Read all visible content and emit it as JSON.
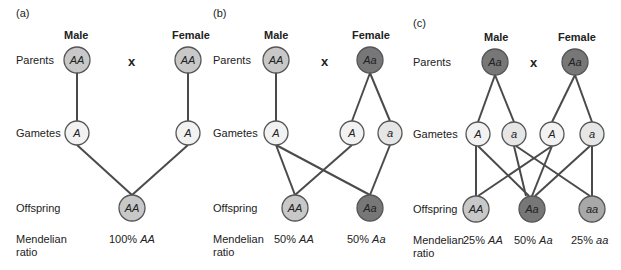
{
  "colors": {
    "homo_dominant": "#c8c8c8",
    "hetero": "#777777",
    "homo_recessive": "#a8a8a8",
    "gamete": "#f2f2f2",
    "line": "#4a4a4a"
  },
  "row_labels": {
    "parents": "Parents",
    "gametes": "Gametes",
    "offspring": "Offspring",
    "ratio_line1": "Mendelian",
    "ratio_line2": "ratio"
  },
  "cross_symbol": "x",
  "panels": [
    {
      "id": "a",
      "label": "(a)",
      "male_label": "Male",
      "female_label": "Female",
      "parents": {
        "male": "AA",
        "female": "AA"
      },
      "gametes": [
        "A",
        "A"
      ],
      "offspring": [
        "AA"
      ],
      "ratios": [
        {
          "pct": "100%",
          "genotype": "AA"
        }
      ]
    },
    {
      "id": "b",
      "label": "(b)",
      "male_label": "Male",
      "female_label": "Female",
      "parents": {
        "male": "AA",
        "female": "Aa"
      },
      "gametes": [
        "A",
        "A",
        "a"
      ],
      "offspring": [
        "AA",
        "Aa"
      ],
      "ratios": [
        {
          "pct": "50%",
          "genotype": "AA"
        },
        {
          "pct": "50%",
          "genotype": "Aa"
        }
      ]
    },
    {
      "id": "c",
      "label": "(c)",
      "male_label": "Male",
      "female_label": "Female",
      "parents": {
        "male": "Aa",
        "female": "Aa"
      },
      "gametes": [
        "A",
        "a",
        "A",
        "a"
      ],
      "offspring": [
        "AA",
        "Aa",
        "aa"
      ],
      "ratios": [
        {
          "pct": "25%",
          "genotype": "AA"
        },
        {
          "pct": "50%",
          "genotype": "Aa"
        },
        {
          "pct": "25%",
          "genotype": "aa"
        }
      ]
    }
  ]
}
